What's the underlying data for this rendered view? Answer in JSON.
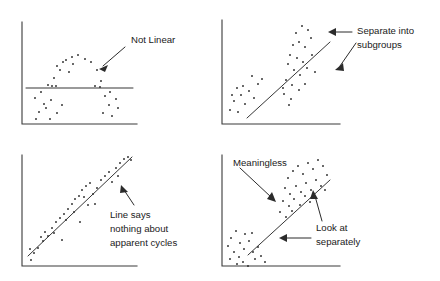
{
  "figure": {
    "background_color": "#ffffff",
    "ink_color": "#2b2b2b",
    "axis_color": "#3a3a3a",
    "width": 440,
    "height": 281
  },
  "chart_data": [
    {
      "id": "panel-not-linear",
      "type": "scatter",
      "title": "",
      "xlabel": "",
      "ylabel": "",
      "grid": false,
      "legend": "none",
      "annotation": "Not Linear",
      "fit_line": {
        "kind": "horizontal",
        "x": [
          26,
          133
        ],
        "y": [
          88,
          88
        ]
      },
      "points": [
        [
          35,
          98
        ],
        [
          41,
          92
        ],
        [
          46,
          108
        ],
        [
          39,
          112
        ],
        [
          51,
          100
        ],
        [
          57,
          113
        ],
        [
          50,
          119
        ],
        [
          62,
          105
        ],
        [
          36,
          119
        ],
        [
          44,
          104
        ],
        [
          54,
          78
        ],
        [
          57,
          66
        ],
        [
          63,
          62
        ],
        [
          66,
          60
        ],
        [
          72,
          57
        ],
        [
          78,
          55
        ],
        [
          85,
          59
        ],
        [
          91,
          62
        ],
        [
          69,
          72
        ],
        [
          60,
          70
        ],
        [
          97,
          70
        ],
        [
          101,
          81
        ],
        [
          95,
          86
        ],
        [
          105,
          96
        ],
        [
          110,
          92
        ],
        [
          116,
          99
        ],
        [
          109,
          105
        ],
        [
          118,
          108
        ],
        [
          103,
          113
        ],
        [
          112,
          116
        ],
        [
          48,
          85
        ],
        [
          52,
          86
        ],
        [
          56,
          86
        ],
        [
          100,
          87
        ],
        [
          73,
          64
        ]
      ],
      "xlim": [
        22,
        137
      ],
      "ylim": [
        22,
        124
      ]
    },
    {
      "id": "panel-separate-subgroups",
      "type": "scatter",
      "title": "",
      "xlabel": "",
      "ylabel": "",
      "grid": false,
      "legend": "none",
      "annotation": "Separate into subgroups",
      "fit_line": {
        "kind": "regression",
        "x": [
          247,
          330
        ],
        "y": [
          118,
          42
        ]
      },
      "points": [
        [
          230,
          110
        ],
        [
          234,
          101
        ],
        [
          238,
          112
        ],
        [
          241,
          95
        ],
        [
          245,
          104
        ],
        [
          232,
          95
        ],
        [
          249,
          91
        ],
        [
          254,
          98
        ],
        [
          243,
          86
        ],
        [
          237,
          88
        ],
        [
          258,
          84
        ],
        [
          262,
          79
        ],
        [
          252,
          76
        ],
        [
          296,
          33
        ],
        [
          302,
          26
        ],
        [
          308,
          30
        ],
        [
          299,
          42
        ],
        [
          305,
          47
        ],
        [
          293,
          45
        ],
        [
          311,
          38
        ],
        [
          290,
          55
        ],
        [
          297,
          58
        ],
        [
          303,
          62
        ],
        [
          288,
          64
        ],
        [
          294,
          70
        ],
        [
          300,
          75
        ],
        [
          307,
          68
        ],
        [
          286,
          80
        ],
        [
          292,
          85
        ],
        [
          299,
          90
        ],
        [
          305,
          84
        ],
        [
          284,
          94
        ],
        [
          291,
          99
        ],
        [
          312,
          55
        ],
        [
          315,
          72
        ],
        [
          289,
          105
        ],
        [
          283,
          88
        ]
      ],
      "xlim": [
        222,
        340
      ],
      "ylim": [
        20,
        124
      ]
    },
    {
      "id": "panel-apparent-cycles",
      "type": "scatter",
      "title": "",
      "xlabel": "",
      "ylabel": "",
      "grid": false,
      "legend": "none",
      "annotation": "Line says nothing about apparent cycles",
      "fit_line": {
        "kind": "regression",
        "x": [
          28,
          132
        ],
        "y": [
          256,
          157
        ]
      },
      "points": [
        [
          31,
          260
        ],
        [
          34,
          253
        ],
        [
          38,
          248
        ],
        [
          30,
          249
        ],
        [
          41,
          237
        ],
        [
          45,
          232
        ],
        [
          48,
          236
        ],
        [
          43,
          241
        ],
        [
          52,
          228
        ],
        [
          56,
          222
        ],
        [
          60,
          218
        ],
        [
          54,
          233
        ],
        [
          64,
          214
        ],
        [
          68,
          209
        ],
        [
          72,
          204
        ],
        [
          66,
          220
        ],
        [
          75,
          199
        ],
        [
          79,
          196
        ],
        [
          74,
          212
        ],
        [
          82,
          190
        ],
        [
          86,
          186
        ],
        [
          90,
          183
        ],
        [
          84,
          197
        ],
        [
          93,
          194
        ],
        [
          97,
          188
        ],
        [
          88,
          205
        ],
        [
          101,
          180
        ],
        [
          105,
          176
        ],
        [
          109,
          172
        ],
        [
          112,
          182
        ],
        [
          116,
          168
        ],
        [
          120,
          163
        ],
        [
          124,
          159
        ],
        [
          128,
          157
        ],
        [
          131,
          160
        ],
        [
          118,
          176
        ],
        [
          95,
          204
        ],
        [
          80,
          222
        ],
        [
          62,
          240
        ]
      ],
      "xlim": [
        22,
        137
      ],
      "ylim": [
        155,
        266
      ]
    },
    {
      "id": "panel-look-at-separately",
      "type": "scatter",
      "title": "",
      "xlabel": "",
      "ylabel": "",
      "grid": false,
      "legend": "none",
      "annotations": [
        "Meaningless",
        "Look at separately"
      ],
      "fit_line": {
        "kind": "regression",
        "x": [
          248,
          330
        ],
        "y": [
          255,
          180
        ]
      },
      "points": [
        [
          231,
          238
        ],
        [
          236,
          231
        ],
        [
          240,
          243
        ],
        [
          245,
          234
        ],
        [
          228,
          246
        ],
        [
          234,
          252
        ],
        [
          239,
          257
        ],
        [
          244,
          249
        ],
        [
          249,
          241
        ],
        [
          253,
          252
        ],
        [
          230,
          259
        ],
        [
          237,
          264
        ],
        [
          243,
          262
        ],
        [
          248,
          266
        ],
        [
          255,
          259
        ],
        [
          252,
          233
        ],
        [
          258,
          247
        ],
        [
          261,
          256
        ],
        [
          265,
          262
        ],
        [
          288,
          178
        ],
        [
          293,
          171
        ],
        [
          298,
          166
        ],
        [
          303,
          174
        ],
        [
          308,
          163
        ],
        [
          313,
          169
        ],
        [
          318,
          160
        ],
        [
          323,
          166
        ],
        [
          285,
          188
        ],
        [
          290,
          194
        ],
        [
          296,
          186
        ],
        [
          301,
          192
        ],
        [
          306,
          183
        ],
        [
          311,
          190
        ],
        [
          316,
          180
        ],
        [
          321,
          186
        ],
        [
          283,
          201
        ],
        [
          289,
          206
        ],
        [
          294,
          199
        ],
        [
          300,
          205
        ],
        [
          305,
          196
        ],
        [
          310,
          202
        ],
        [
          327,
          175
        ],
        [
          325,
          190
        ],
        [
          280,
          212
        ],
        [
          286,
          217
        ],
        [
          292,
          211
        ]
      ],
      "xlim": [
        222,
        340
      ],
      "ylim": [
        155,
        266
      ]
    }
  ],
  "panels": [
    {
      "name": "not-linear",
      "callout": {
        "text": "Not Linear",
        "x": 131,
        "y": 38
      }
    },
    {
      "name": "separate-into-subgroups",
      "callout": {
        "line1": "Separate into",
        "line2": "subgroups",
        "x": 357,
        "y": 26
      }
    },
    {
      "name": "apparent-cycles",
      "callout": {
        "line1": "Line says",
        "line2": "nothing about",
        "line3": "apparent cycles",
        "x": 110,
        "y": 212
      }
    },
    {
      "name": "look-at-separately",
      "callouts": [
        {
          "text": "Meaningless",
          "x": 233,
          "y": 160
        },
        {
          "line1": "Look at",
          "line2": "separately",
          "x": 318,
          "y": 224
        }
      ]
    }
  ]
}
